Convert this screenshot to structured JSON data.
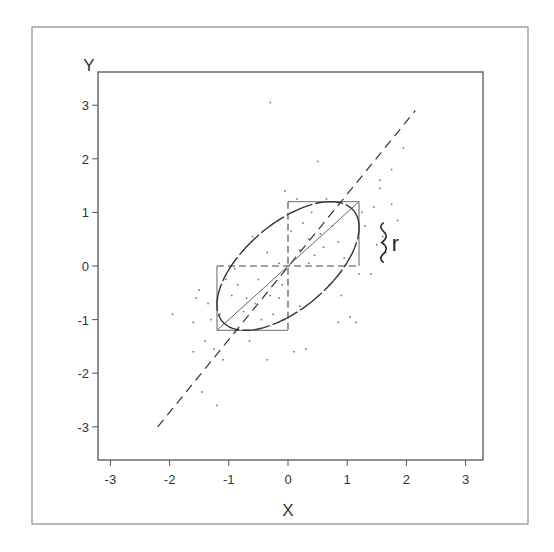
{
  "chart_data": {
    "type": "scatter",
    "title": "",
    "xlabel": "X",
    "ylabel": "Y",
    "xlim": [
      -3.25,
      3.25
    ],
    "ylim": [
      -3.6,
      3.6
    ],
    "x_ticks": [
      "-3",
      "-2",
      "-1",
      "0",
      "1",
      "2",
      "3"
    ],
    "y_ticks": [
      "3",
      "2",
      "1",
      "0",
      "-1",
      "-2",
      "-3"
    ],
    "grid": false,
    "legend": null,
    "annotation": {
      "text": "r",
      "glyph": "}",
      "x": 1.65,
      "y": 0.4
    },
    "correlation_r": 0.6,
    "regression_line": {
      "style": "dashed",
      "from": [
        -2.2,
        -3.0
      ],
      "to": [
        2.15,
        2.9
      ]
    },
    "major_axis_line": {
      "style": "solid",
      "from": [
        -1.2,
        -1.2
      ],
      "to": [
        1.2,
        1.2
      ]
    },
    "ellipse": {
      "center": [
        0,
        0
      ],
      "bounding_box": [
        -1.2,
        -1.2,
        1.2,
        1.2
      ],
      "r": 0.6
    },
    "upper_box": {
      "x": [
        0,
        1.2
      ],
      "y": [
        0,
        1.2
      ]
    },
    "lower_box": {
      "x": [
        -1.2,
        0
      ],
      "y": [
        -1.2,
        0
      ]
    },
    "points": [
      [
        -0.3,
        3.05
      ],
      [
        -1.95,
        -0.9
      ],
      [
        -1.6,
        -1.05
      ],
      [
        -1.55,
        -0.6
      ],
      [
        -1.5,
        -0.45
      ],
      [
        -1.35,
        -0.7
      ],
      [
        -1.3,
        -1.0
      ],
      [
        -1.4,
        -1.4
      ],
      [
        -1.25,
        -1.55
      ],
      [
        -1.6,
        -1.6
      ],
      [
        -1.1,
        -1.75
      ],
      [
        -1.45,
        -2.35
      ],
      [
        -1.2,
        -2.6
      ],
      [
        -0.9,
        -0.05
      ],
      [
        -0.85,
        -0.35
      ],
      [
        -0.7,
        -0.6
      ],
      [
        -0.5,
        -0.25
      ],
      [
        -0.55,
        -0.7
      ],
      [
        -0.3,
        -0.55
      ],
      [
        -0.25,
        -0.9
      ],
      [
        -0.45,
        -1.0
      ],
      [
        -0.15,
        -0.6
      ],
      [
        -0.1,
        -0.35
      ],
      [
        0.2,
        -0.75
      ],
      [
        -0.65,
        -1.4
      ],
      [
        -0.35,
        -1.75
      ],
      [
        0.1,
        -1.6
      ],
      [
        0.3,
        -1.55
      ],
      [
        -0.75,
        -0.85
      ],
      [
        -0.95,
        -0.55
      ],
      [
        0.2,
        0.3
      ],
      [
        0.35,
        0.5
      ],
      [
        0.45,
        0.2
      ],
      [
        0.55,
        0.6
      ],
      [
        0.6,
        0.35
      ],
      [
        0.75,
        0.75
      ],
      [
        0.85,
        0.45
      ],
      [
        0.95,
        0.15
      ],
      [
        0.25,
        0.8
      ],
      [
        0.4,
        1.0
      ],
      [
        0.65,
        1.25
      ],
      [
        0.15,
        1.25
      ],
      [
        -0.05,
        1.4
      ],
      [
        0.5,
        1.95
      ],
      [
        0.35,
        0.05
      ],
      [
        0.7,
        -0.35
      ],
      [
        0.9,
        -0.55
      ],
      [
        1.2,
        -0.15
      ],
      [
        1.25,
        1.0
      ],
      [
        1.55,
        1.45
      ],
      [
        1.45,
        1.1
      ],
      [
        1.75,
        1.15
      ],
      [
        1.85,
        0.85
      ],
      [
        1.5,
        0.4
      ],
      [
        1.3,
        0.75
      ],
      [
        1.6,
        0.55
      ],
      [
        1.65,
        0.25
      ],
      [
        1.4,
        -0.15
      ],
      [
        1.05,
        -0.95
      ],
      [
        0.85,
        -1.05
      ],
      [
        1.15,
        -1.05
      ],
      [
        1.75,
        1.8
      ],
      [
        1.95,
        2.2
      ],
      [
        1.55,
        1.6
      ],
      [
        -0.15,
        0.05
      ],
      [
        0.05,
        0.65
      ],
      [
        -0.6,
        0.55
      ],
      [
        -0.35,
        0.25
      ],
      [
        -0.75,
        0.3
      ],
      [
        -1.05,
        -0.25
      ],
      [
        -1.15,
        -0.9
      ]
    ]
  }
}
